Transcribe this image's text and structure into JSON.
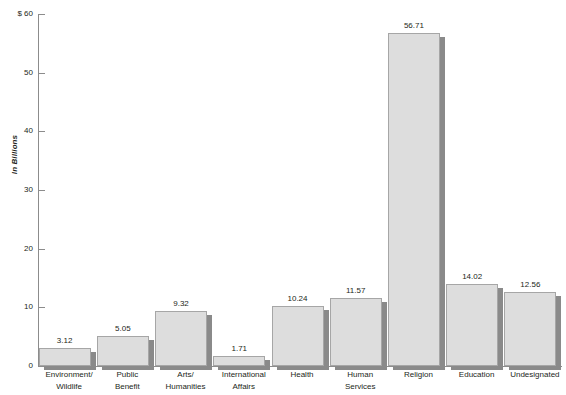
{
  "chart_data": {
    "type": "bar",
    "title": "",
    "xlabel": "",
    "ylabel": "In Billions",
    "y_axis_prefix": "$",
    "ylim": [
      0,
      60
    ],
    "ytick_values": [
      0,
      10,
      20,
      30,
      40,
      50,
      60
    ],
    "ytick_labels": [
      "0",
      "10",
      "20",
      "30",
      "40",
      "50",
      "$ 60"
    ],
    "grid": false,
    "legend": null,
    "categories": [
      "Environment/ Wildlife",
      "Public Benefit",
      "Arts/ Humanities",
      "International Affairs",
      "Health",
      "Human Services",
      "Religion",
      "Education",
      "Undesignated"
    ],
    "category_lines": [
      [
        "Environment/",
        "Wildlife"
      ],
      [
        "Public",
        "Benefit"
      ],
      [
        "Arts/",
        "Humanities"
      ],
      [
        "International",
        "Affairs"
      ],
      [
        "Health",
        ""
      ],
      [
        "Human",
        "Services"
      ],
      [
        "Religion",
        ""
      ],
      [
        "Education",
        ""
      ],
      [
        "Undesignated",
        ""
      ]
    ],
    "values": [
      3.12,
      5.05,
      9.32,
      1.71,
      10.24,
      11.57,
      56.71,
      14.02,
      12.56
    ],
    "value_labels": [
      "3.12",
      "5.05",
      "9.32",
      "1.71",
      "10.24",
      "11.57",
      "56.71",
      "14.02",
      "12.56"
    ],
    "colors": {
      "bar_fill": "#dddddd",
      "bar_border": "#a6a6a6",
      "bar_shadow": "#8a8a8a",
      "axis": "#8c8c8c",
      "text": "#231f20",
      "background": "#ffffff"
    }
  }
}
